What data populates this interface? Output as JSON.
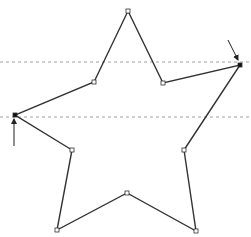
{
  "diagram": {
    "width": 251,
    "height": 237,
    "stroke_color": "#333333",
    "guide_color": "#888888",
    "star": {
      "points": [
        {
          "x": 128,
          "y": 11,
          "filled": false
        },
        {
          "x": 163,
          "y": 83,
          "filled": false
        },
        {
          "x": 240,
          "y": 65,
          "filled": true
        },
        {
          "x": 184,
          "y": 150,
          "filled": false
        },
        {
          "x": 196,
          "y": 231,
          "filled": false
        },
        {
          "x": 127,
          "y": 193,
          "filled": false
        },
        {
          "x": 57,
          "y": 230,
          "filled": false
        },
        {
          "x": 72,
          "y": 150,
          "filled": false
        },
        {
          "x": 15,
          "y": 115,
          "filled": true
        },
        {
          "x": 94,
          "y": 82,
          "filled": false
        }
      ]
    },
    "guides": [
      {
        "y": 62
      },
      {
        "y": 117
      }
    ],
    "arrows": [
      {
        "name": "right-tip-arrow",
        "x1": 228,
        "y1": 40,
        "x2": 238,
        "y2": 60
      },
      {
        "name": "left-tip-arrow",
        "x1": 14,
        "y1": 146,
        "x2": 14,
        "y2": 119
      }
    ]
  }
}
